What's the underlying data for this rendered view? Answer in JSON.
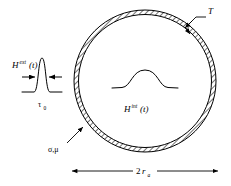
{
  "figure": {
    "background_color": "#ffffff",
    "line_color": "#000000",
    "hatch_color": "#000000",
    "shell": {
      "center_x": 145,
      "center_y": 81,
      "outer_radius": 71,
      "inner_radius": 66.5
    }
  },
  "labels": {
    "external_field": {
      "symbol": "H",
      "superscript": "ext",
      "argument": "(t)"
    },
    "pulse_width": {
      "symbol": "τ",
      "subscript": "0"
    },
    "internal_field": {
      "symbol": "H",
      "superscript": "int",
      "argument": "(t)"
    },
    "thickness": {
      "symbol": "T"
    },
    "material_properties": {
      "text": "σ,μ"
    },
    "diameter": {
      "prefix": "2",
      "symbol": "r",
      "subscript": "a"
    }
  },
  "elements": {
    "external_pulse_name": "narrow-tall-pulse",
    "internal_pulse_name": "broad-low-pulse",
    "diameter_arrow_name": "double-headed-arrow",
    "thickness_leader_name": "leader-line-with-arrow",
    "material_leader_name": "leader-line-with-arrow"
  }
}
